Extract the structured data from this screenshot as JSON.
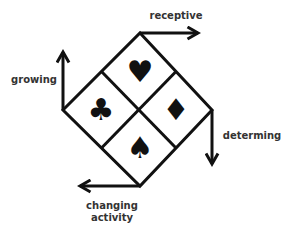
{
  "diagram": {
    "labels": {
      "receptive": "receptive",
      "growing": "growing",
      "determing": "determing",
      "changing_line1": "changing",
      "changing_line2": "activity"
    },
    "quadrants": [
      {
        "position": "top",
        "suit": "heart",
        "glyph": "♥"
      },
      {
        "position": "left",
        "suit": "club",
        "glyph": "♣"
      },
      {
        "position": "right",
        "suit": "diamond",
        "glyph": "♦"
      },
      {
        "position": "bottom",
        "suit": "spade",
        "glyph": "♠"
      }
    ],
    "colors": {
      "stroke": "#111111",
      "text": "#333333",
      "background": "#ffffff"
    }
  }
}
